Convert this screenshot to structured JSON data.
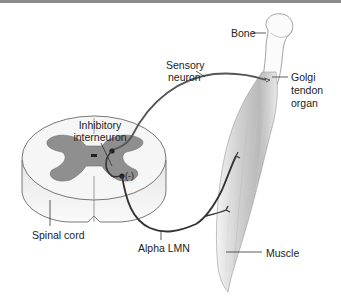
{
  "figure": {
    "type": "anatomical-diagram",
    "labels": {
      "bone": "Bone",
      "sensory_neuron_line1": "Sensory",
      "sensory_neuron_line2": "neuron",
      "golgi_line1": "Golgi",
      "golgi_line2": "tendon",
      "golgi_line3": "organ",
      "inhibitory_line1": "Inhibitory",
      "inhibitory_line2": "interneuron",
      "inhibition_sign": "(-)",
      "spinal_cord": "Spinal cord",
      "alpha_lmn": "Alpha LMN",
      "muscle": "Muscle"
    },
    "colors": {
      "gray_matter": "#8f8f8f",
      "white_matter": "#f2f2f2",
      "neuron_line": "#3a3a3a",
      "muscle_shade": "#c8c8c8",
      "top_rule": "#8c8c8c"
    }
  }
}
